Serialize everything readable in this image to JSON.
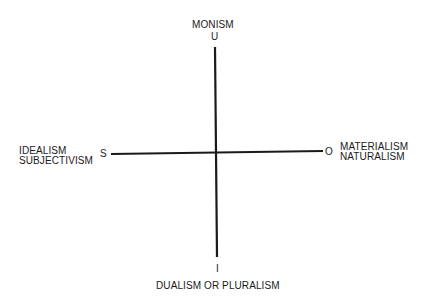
{
  "diagram": {
    "type": "quadrant-axes",
    "vertical_axis": {
      "top_pole": "U",
      "top_label": "MONISM",
      "bottom_pole": "I",
      "bottom_label": "DUALISM OR PLURALISM"
    },
    "horizontal_axis": {
      "left_pole": "S",
      "left_label_line1": "IDEALISM",
      "left_label_line2": "SUBJECTIVISM",
      "right_pole": "O",
      "right_label_line1": "MATERIALISM",
      "right_label_line2": "NATURALISM"
    },
    "line_color": "#1a1a1a"
  }
}
